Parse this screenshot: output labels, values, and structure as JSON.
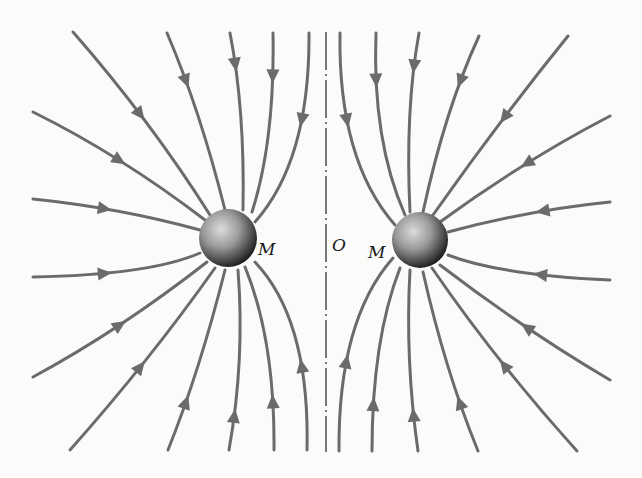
{
  "diagram": {
    "labels": {
      "left_mass": "M",
      "right_mass": "M",
      "origin": "O"
    },
    "colors": {
      "background": "#fbfbfa",
      "field_line": "#6b6b6b",
      "axis": "#222222",
      "sphere_light": "#d8d8d8",
      "sphere_dark": "#1e1e1e"
    },
    "spheres": [
      {
        "name": "left",
        "cx": 228,
        "cy": 238,
        "r": 29
      },
      {
        "name": "right",
        "cx": 420,
        "cy": 240,
        "r": 28
      }
    ],
    "axis": {
      "x": 326,
      "y1": 32,
      "y2": 452,
      "style": "dash-dot"
    },
    "field_lines": [
      {
        "p0": [
          73,
          32
        ],
        "c": [
          150,
          120
        ],
        "p1": [
          210,
          215
        ],
        "arrow": [
          145,
          112
        ]
      },
      {
        "p0": [
          167,
          33
        ],
        "c": [
          200,
          110
        ],
        "p1": [
          225,
          210
        ],
        "arrow": [
          187,
          80
        ]
      },
      {
        "p0": [
          230,
          33
        ],
        "c": [
          245,
          110
        ],
        "p1": [
          243,
          210
        ],
        "arrow": [
          237,
          65
        ]
      },
      {
        "p0": [
          273,
          33
        ],
        "c": [
          275,
          140
        ],
        "p1": [
          252,
          212
        ],
        "arrow": [
          274,
          77
        ]
      },
      {
        "p0": [
          309,
          33
        ],
        "c": [
          310,
          160
        ],
        "p1": [
          255,
          222
        ],
        "arrow": [
          304,
          120
        ]
      },
      {
        "p0": [
          33,
          112
        ],
        "c": [
          120,
          155
        ],
        "p1": [
          205,
          220
        ],
        "arrow": [
          120,
          158
        ]
      },
      {
        "p0": [
          33,
          199
        ],
        "c": [
          120,
          208
        ],
        "p1": [
          200,
          230
        ],
        "arrow": [
          105,
          210
        ]
      },
      {
        "p0": [
          33,
          277
        ],
        "c": [
          150,
          275
        ],
        "p1": [
          200,
          253
        ],
        "arrow": [
          105,
          272
        ]
      },
      {
        "p0": [
          33,
          377
        ],
        "c": [
          120,
          330
        ],
        "p1": [
          207,
          262
        ],
        "arrow": [
          122,
          328
        ]
      },
      {
        "p0": [
          70,
          450
        ],
        "c": [
          150,
          360
        ],
        "p1": [
          215,
          268
        ],
        "arrow": [
          145,
          370
        ]
      },
      {
        "p0": [
          168,
          450
        ],
        "c": [
          200,
          370
        ],
        "p1": [
          225,
          270
        ],
        "arrow": [
          188,
          402
        ]
      },
      {
        "p0": [
          229,
          450
        ],
        "c": [
          245,
          360
        ],
        "p1": [
          238,
          270
        ],
        "arrow": [
          235,
          415
        ]
      },
      {
        "p0": [
          274,
          450
        ],
        "c": [
          275,
          340
        ],
        "p1": [
          245,
          267
        ],
        "arrow": [
          274,
          402
        ]
      },
      {
        "p0": [
          307,
          450
        ],
        "c": [
          310,
          320
        ],
        "p1": [
          255,
          262
        ],
        "arrow": [
          303,
          365
        ]
      },
      {
        "p0": [
          340,
          33
        ],
        "c": [
          338,
          160
        ],
        "p1": [
          395,
          225
        ],
        "arrow": [
          345,
          120
        ]
      },
      {
        "p0": [
          376,
          33
        ],
        "c": [
          372,
          140
        ],
        "p1": [
          405,
          215
        ],
        "arrow": [
          375,
          80
        ]
      },
      {
        "p0": [
          419,
          33
        ],
        "c": [
          405,
          110
        ],
        "p1": [
          410,
          212
        ],
        "arrow": [
          413,
          67
        ]
      },
      {
        "p0": [
          479,
          36
        ],
        "c": [
          445,
          110
        ],
        "p1": [
          423,
          212
        ],
        "arrow": [
          460,
          82
        ]
      },
      {
        "p0": [
          568,
          36
        ],
        "c": [
          500,
          120
        ],
        "p1": [
          433,
          215
        ],
        "arrow": [
          502,
          115
        ]
      },
      {
        "p0": [
          610,
          116
        ],
        "c": [
          525,
          160
        ],
        "p1": [
          440,
          222
        ],
        "arrow": [
          526,
          162
        ]
      },
      {
        "p0": [
          610,
          202
        ],
        "c": [
          530,
          210
        ],
        "p1": [
          448,
          232
        ],
        "arrow": [
          543,
          212
        ]
      },
      {
        "p0": [
          610,
          280
        ],
        "c": [
          500,
          275
        ],
        "p1": [
          448,
          255
        ],
        "arrow": [
          540,
          273
        ]
      },
      {
        "p0": [
          610,
          380
        ],
        "c": [
          525,
          330
        ],
        "p1": [
          440,
          265
        ],
        "arrow": [
          525,
          330
        ]
      },
      {
        "p0": [
          577,
          451
        ],
        "c": [
          495,
          360
        ],
        "p1": [
          432,
          268
        ],
        "arrow": [
          500,
          368
        ]
      },
      {
        "p0": [
          478,
          451
        ],
        "c": [
          445,
          370
        ],
        "p1": [
          423,
          272
        ],
        "arrow": [
          458,
          404
        ]
      },
      {
        "p0": [
          418,
          451
        ],
        "c": [
          405,
          360
        ],
        "p1": [
          410,
          270
        ],
        "arrow": [
          413,
          415
        ]
      },
      {
        "p0": [
          372,
          451
        ],
        "c": [
          372,
          340
        ],
        "p1": [
          400,
          268
        ],
        "arrow": [
          372,
          403
        ]
      },
      {
        "p0": [
          339,
          451
        ],
        "c": [
          338,
          320
        ],
        "p1": [
          393,
          258
        ],
        "arrow": [
          345,
          362
        ]
      }
    ]
  }
}
